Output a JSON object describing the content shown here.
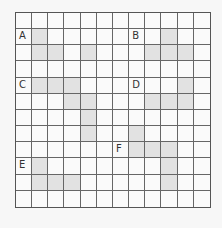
{
  "grid": {
    "rows": 12,
    "cols": 12,
    "colors": {
      "background": "#fafafa",
      "shaded": "#e2e2e2",
      "line": "#666666"
    },
    "labels": [
      {
        "text": "A",
        "row": 1,
        "col": 0
      },
      {
        "text": "B",
        "row": 1,
        "col": 7
      },
      {
        "text": "C",
        "row": 4,
        "col": 0
      },
      {
        "text": "D",
        "row": 4,
        "col": 7
      },
      {
        "text": "F",
        "row": 8,
        "col": 6
      },
      {
        "text": "E",
        "row": 9,
        "col": 0
      }
    ],
    "shapes": [
      {
        "label": "A",
        "cells": [
          [
            1,
            1
          ],
          [
            2,
            1
          ],
          [
            2,
            2
          ],
          [
            2,
            4
          ]
        ]
      },
      {
        "label": "B",
        "cells": [
          [
            1,
            9
          ],
          [
            2,
            8
          ],
          [
            2,
            9
          ],
          [
            2,
            10
          ]
        ]
      },
      {
        "label": "C",
        "cells": [
          [
            4,
            1
          ],
          [
            4,
            2
          ],
          [
            4,
            3
          ],
          [
            5,
            3
          ],
          [
            5,
            4
          ],
          [
            6,
            4
          ],
          [
            7,
            4
          ]
        ]
      },
      {
        "label": "D",
        "cells": [
          [
            4,
            10
          ],
          [
            5,
            8
          ],
          [
            5,
            9
          ],
          [
            5,
            10
          ]
        ]
      },
      {
        "label": "F",
        "cells": [
          [
            7,
            7
          ],
          [
            8,
            7
          ],
          [
            8,
            8
          ],
          [
            8,
            9
          ],
          [
            9,
            9
          ],
          [
            10,
            9
          ]
        ]
      },
      {
        "label": "E",
        "cells": [
          [
            9,
            1
          ],
          [
            10,
            1
          ],
          [
            10,
            2
          ],
          [
            10,
            3
          ]
        ]
      }
    ]
  }
}
